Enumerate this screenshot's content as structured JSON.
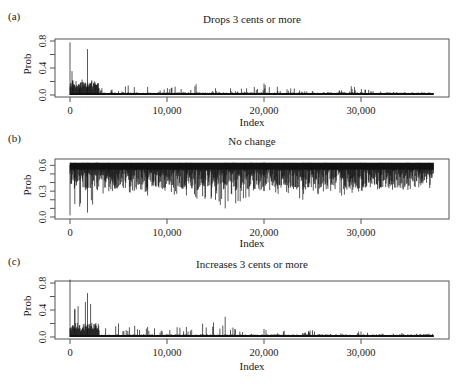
{
  "chart_data": [
    {
      "type": "line",
      "panel": "(a)",
      "title": "Drops 3 cents or more",
      "xlabel": "Index",
      "ylabel": "Prob",
      "xlim": [
        0,
        37500
      ],
      "ylim": [
        0.0,
        0.8
      ],
      "xticks": [
        0,
        10000,
        20000,
        30000
      ],
      "xtick_labels": [
        "0",
        "10,000",
        "20,000",
        "30,000"
      ],
      "yticks": [
        0.0,
        0.2,
        0.4,
        0.6,
        0.8
      ],
      "ytick_labels": [
        "0.0",
        "0.4",
        "0.8"
      ],
      "grid": false,
      "description": "Spiky probability series, mostly near 0.0-0.1; large spikes ~0.78 near index 0 and ~0.68 near index 1,800; early values ~0.2 decaying to ~0.03",
      "x": [
        0,
        300,
        1000,
        1800,
        3000,
        6000,
        8000,
        13000,
        15000,
        19000,
        20000,
        25000,
        28000,
        29000,
        32000,
        37000
      ],
      "values": [
        0.78,
        0.22,
        0.15,
        0.68,
        0.1,
        0.14,
        0.12,
        0.16,
        0.1,
        0.12,
        0.17,
        0.06,
        0.07,
        0.13,
        0.05,
        0.04
      ]
    },
    {
      "type": "line",
      "panel": "(b)",
      "title": "No change",
      "xlabel": "Index",
      "ylabel": "Prob",
      "xlim": [
        0,
        37500
      ],
      "ylim": [
        0.0,
        0.65
      ],
      "xticks": [
        0,
        10000,
        20000,
        30000
      ],
      "xtick_labels": [
        "0",
        "10,000",
        "20,000",
        "30,000"
      ],
      "yticks": [
        0.0,
        0.1,
        0.2,
        0.3,
        0.4,
        0.5,
        0.6
      ],
      "ytick_labels": [
        "0.0",
        "0.3",
        "0.6"
      ],
      "grid": false,
      "description": "Dense series near upper bound ~0.65 with downward spikes; minima ~0.02 near index 0, ~0.1 near 16,000, rising floor toward the end (~0.45-0.55)",
      "x": [
        0,
        500,
        1800,
        4000,
        8000,
        12000,
        16000,
        20000,
        24000,
        28000,
        32000,
        36000,
        37000
      ],
      "values": [
        0.02,
        0.15,
        0.05,
        0.3,
        0.25,
        0.25,
        0.1,
        0.3,
        0.2,
        0.25,
        0.35,
        0.45,
        0.5
      ]
    },
    {
      "type": "line",
      "panel": "(c)",
      "title": "Increases 3 cents or more",
      "xlabel": "Index",
      "ylabel": "Prob",
      "xlim": [
        0,
        37500
      ],
      "ylim": [
        0.0,
        0.8
      ],
      "xticks": [
        0,
        10000,
        20000,
        30000
      ],
      "xtick_labels": [
        "0",
        "10,000",
        "20,000",
        "30,000"
      ],
      "yticks": [
        0.0,
        0.2,
        0.4,
        0.6,
        0.8
      ],
      "ytick_labels": [
        "0.0",
        "0.4",
        "0.8"
      ],
      "grid": false,
      "description": "Spiky series; spikes ~0.85 near index 0, ~0.42 near 500, ~0.65 near 1,800, ~0.3 near 16,000; baseline shifts downward after ~17,500",
      "x": [
        0,
        500,
        1800,
        3000,
        5000,
        8000,
        12000,
        16000,
        17500,
        20000,
        25000,
        30000,
        37000
      ],
      "values": [
        0.85,
        0.42,
        0.65,
        0.1,
        0.2,
        0.15,
        0.15,
        0.3,
        0.08,
        0.12,
        0.1,
        0.08,
        0.05
      ]
    }
  ],
  "panels": [
    {
      "label": "(a)",
      "title": "Drops 3 cents or more",
      "xlabel": "Index",
      "ylabel": "Prob",
      "yticks": [
        "0.0",
        "0.4",
        "0.8"
      ]
    },
    {
      "label": "(b)",
      "title": "No change",
      "xlabel": "Index",
      "ylabel": "Prob",
      "yticks": [
        "0.0",
        "0.3",
        "0.6"
      ]
    },
    {
      "label": "(c)",
      "title": "Increases 3 cents or more",
      "xlabel": "Index",
      "ylabel": "Prob",
      "yticks": [
        "0.0",
        "0.4",
        "0.8"
      ]
    }
  ],
  "xtick_labels": [
    "0",
    "10,000",
    "20,000",
    "30,000"
  ],
  "colors": {
    "line": "#111111",
    "axis": "#555555"
  }
}
